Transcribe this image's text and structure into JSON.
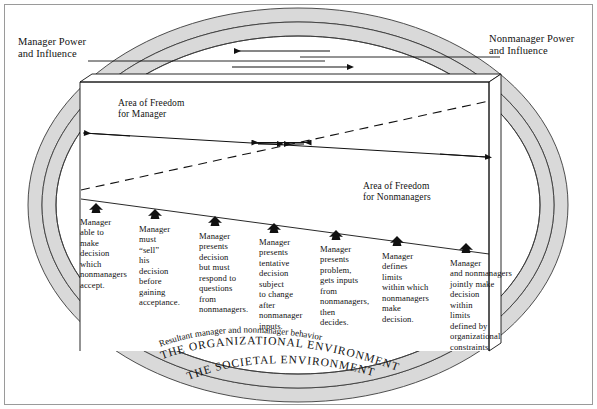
{
  "figure": {
    "outer_border_color": "#9a9a9a",
    "band_fill": "#d9d9d9",
    "band_stroke": "#3b3b3b",
    "line_color": "#111111",
    "background": "#ffffff"
  },
  "labels": {
    "manager_power": "Manager Power\nand Influence",
    "nonmanager_power": "Nonmanager Power\nand Influence",
    "area_freedom_manager": "Area of Freedom\nfor Manager",
    "area_freedom_nonmanagers": "Area of Freedom\nfor Nonmanagers"
  },
  "curved_labels": {
    "resultant": "Resultant manager and nonmanager behavior",
    "organizational": "THE ORGANIZATIONAL ENVIRONMENT",
    "societal": "THE SOCIETAL ENVIRONMENT"
  },
  "icons": {
    "marker": "up-arrow-marker-icon",
    "left_arrow": "left-arrow-icon",
    "right_arrow": "right-arrow-icon",
    "vertical_double_arrow": "vertical-double-arrow-icon"
  },
  "steps": [
    {
      "id": 1,
      "text": "Manager\nable to\nmake\ndecision\nwhich\nnonmanagers\naccept.",
      "x": 80,
      "y": 217,
      "marker_x": 96,
      "marker_y": 209
    },
    {
      "id": 2,
      "text": "Manager\nmust\n“sell”\nhis\ndecision\nbefore\ngaining\nacceptance.",
      "x": 139,
      "y": 224,
      "marker_x": 155,
      "marker_y": 215
    },
    {
      "id": 3,
      "text": "Manager\npresents\ndecision\nbut must\nrespond to\nquestions\nfrom\nnonmanagers.",
      "x": 199,
      "y": 231,
      "marker_x": 215,
      "marker_y": 222
    },
    {
      "id": 4,
      "text": "Manager\npresents\ntentative\ndecision\nsubject\nto change\nafter\nnonmanager\ninputs.",
      "x": 259,
      "y": 237,
      "marker_x": 274,
      "marker_y": 229
    },
    {
      "id": 5,
      "text": "Manager\npresents\nproblem,\ngets inputs\nfrom\nnonmanagers,\nthen\ndecides.",
      "x": 320,
      "y": 244,
      "marker_x": 336,
      "marker_y": 236
    },
    {
      "id": 6,
      "text": "Manager\ndefines\nlimits\nwithin which\nnonmanagers\nmake\ndecision.",
      "x": 382,
      "y": 251,
      "marker_x": 397,
      "marker_y": 242
    },
    {
      "id": 7,
      "text": "Manager\nand nonmanagers\njointly make\ndecision\nwithin\nlimits\ndefined by\norganizational\nconstraints.",
      "x": 450,
      "y": 258,
      "marker_x": 466,
      "marker_y": 249
    }
  ]
}
